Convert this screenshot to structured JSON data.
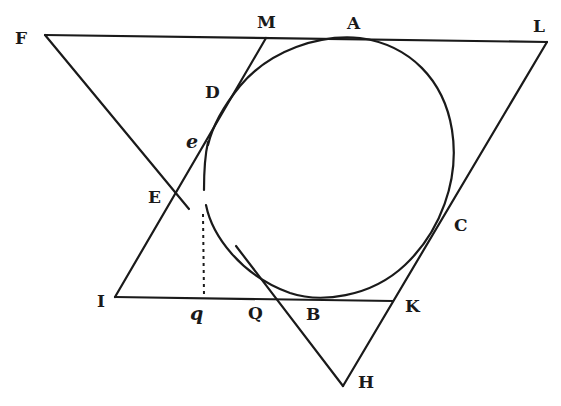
{
  "figure": {
    "type": "geometric construction",
    "colors": {
      "ink": "#1a1a1a",
      "background": "#ffffff"
    }
  },
  "labels": {
    "F": "F",
    "M": "M",
    "A": "A",
    "L": "L",
    "D": "D",
    "e": "e",
    "E": "E",
    "C": "C",
    "I": "I",
    "q": "q",
    "Q": "Q",
    "B": "B",
    "K": "K",
    "H": "H"
  },
  "points": {
    "F": [
      45,
      35
    ],
    "M": [
      266,
      38
    ],
    "A": [
      355,
      38
    ],
    "L": [
      547,
      42
    ],
    "D": [
      236,
      90
    ],
    "e": [
      208,
      140
    ],
    "E": [
      176,
      196
    ],
    "C": [
      424,
      198
    ],
    "I": [
      115,
      297
    ],
    "q": [
      205,
      298
    ],
    "Q": [
      265,
      299
    ],
    "B": [
      318,
      300
    ],
    "K": [
      393,
      301
    ],
    "H": [
      343,
      386
    ]
  },
  "segments": [
    [
      "F",
      "L"
    ],
    [
      "F",
      "E"
    ],
    [
      "L",
      "H"
    ],
    [
      "M",
      "I"
    ],
    [
      "I",
      "K"
    ],
    [
      "Q",
      "H"
    ]
  ]
}
